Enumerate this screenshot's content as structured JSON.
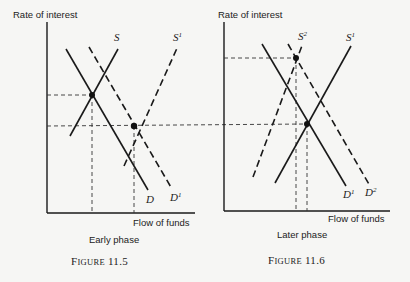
{
  "figures": [
    {
      "id": "fig-11-5",
      "ylabel": "Rate of interest",
      "xlabel": "Flow of funds",
      "phase": "Early phase",
      "caption_prefix": "F",
      "caption_small": "IGURE",
      "caption_num": " 11.5",
      "curves": {
        "S": {
          "label": "S",
          "sup": ""
        },
        "S1": {
          "label": "S",
          "sup": "1"
        },
        "D": {
          "label": "D",
          "sup": ""
        },
        "D1": {
          "label": "D",
          "sup": "1"
        }
      }
    },
    {
      "id": "fig-11-6",
      "ylabel": "Rate of interest",
      "xlabel": "Flow of funds",
      "phase": "Later phase",
      "caption_prefix": "F",
      "caption_small": "IGURE",
      "caption_num": " 11.6",
      "curves": {
        "S2": {
          "label": "S",
          "sup": "2"
        },
        "S1": {
          "label": "S",
          "sup": "1"
        },
        "D1": {
          "label": "D",
          "sup": "1"
        },
        "D2": {
          "label": "D",
          "sup": "2"
        }
      }
    }
  ],
  "colors": {
    "ink": "#1a1a1a",
    "paper": "#f6f6f4"
  }
}
